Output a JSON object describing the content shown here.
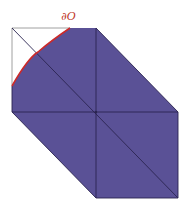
{
  "diagram": {
    "label": "∂O",
    "colors": {
      "fill": "#5a5196",
      "edge": "#2a2450",
      "boundary": "#cc2a2a",
      "outline": "#888888",
      "label": "#c0392b"
    }
  }
}
